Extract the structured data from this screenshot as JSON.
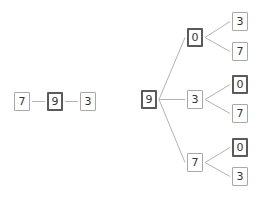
{
  "diagram": {
    "type": "tree-diagram",
    "colors": {
      "edge": "#b3b3b3",
      "node_border": "#a8a8a8",
      "node_border_highlight": "#5a5a5a",
      "text": "#333333",
      "background": "#ffffff"
    },
    "chain": {
      "nodes": [
        {
          "id": "c7",
          "label": "7",
          "x": 14,
          "y": 92,
          "highlight": false
        },
        {
          "id": "c9",
          "label": "9",
          "x": 47,
          "y": 92,
          "highlight": true
        },
        {
          "id": "c3",
          "label": "3",
          "x": 80,
          "y": 92,
          "highlight": false
        }
      ],
      "edges": [
        [
          "c7",
          "c9"
        ],
        [
          "c9",
          "c3"
        ]
      ]
    },
    "tree": {
      "nodes": [
        {
          "id": "r9",
          "label": "9",
          "x": 141,
          "y": 90,
          "highlight": true
        },
        {
          "id": "m0",
          "label": "0",
          "x": 187,
          "y": 28,
          "highlight": true
        },
        {
          "id": "m3",
          "label": "3",
          "x": 187,
          "y": 90,
          "highlight": false
        },
        {
          "id": "m7",
          "label": "7",
          "x": 187,
          "y": 153,
          "highlight": false
        },
        {
          "id": "l0a",
          "label": "3",
          "x": 232,
          "y": 12,
          "highlight": false
        },
        {
          "id": "l0b",
          "label": "7",
          "x": 232,
          "y": 42,
          "highlight": false
        },
        {
          "id": "l3a",
          "label": "0",
          "x": 232,
          "y": 75,
          "highlight": true
        },
        {
          "id": "l3b",
          "label": "7",
          "x": 232,
          "y": 104,
          "highlight": false
        },
        {
          "id": "l7a",
          "label": "0",
          "x": 232,
          "y": 138,
          "highlight": true
        },
        {
          "id": "l7b",
          "label": "3",
          "x": 232,
          "y": 167,
          "highlight": false
        }
      ],
      "edges": [
        [
          "r9",
          "m0"
        ],
        [
          "r9",
          "m3"
        ],
        [
          "r9",
          "m7"
        ],
        [
          "m0",
          "l0a"
        ],
        [
          "m0",
          "l0b"
        ],
        [
          "m3",
          "l3a"
        ],
        [
          "m3",
          "l3b"
        ],
        [
          "m7",
          "l7a"
        ],
        [
          "m7",
          "l7b"
        ]
      ]
    }
  }
}
